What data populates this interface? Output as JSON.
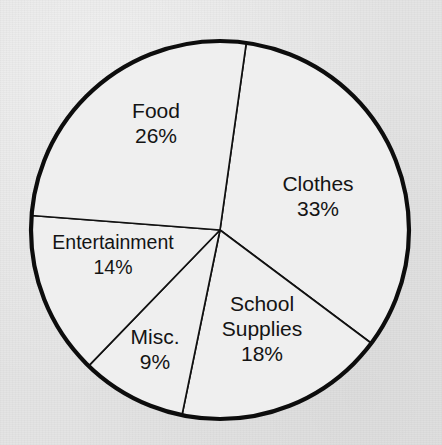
{
  "chart_data": {
    "type": "pie",
    "title": "",
    "subtitle": "",
    "xlabel": "",
    "ylabel": "",
    "legend": "none",
    "grid": false,
    "units": "percent",
    "total": 100,
    "start_angle_deg": 8,
    "direction": "clockwise",
    "categories": [
      "Clothes",
      "School Supplies",
      "Misc.",
      "Entertainment",
      "Food"
    ],
    "values": [
      33,
      18,
      9,
      14,
      26
    ],
    "slices": [
      {
        "name": "clothes",
        "label": "Clothes",
        "value": 33,
        "value_text": "33%",
        "label_lines": [
          "Clothes",
          "33%"
        ],
        "start_angle_deg": 8,
        "end_angle_deg": 126.8,
        "sweep_deg": 118.8,
        "fill": "#efefef",
        "label_x": 318,
        "label_y": 197
      },
      {
        "name": "school-supplies",
        "label": "School Supplies",
        "value": 18,
        "value_text": "18%",
        "label_lines": [
          "School",
          "Supplies",
          "18%"
        ],
        "start_angle_deg": 126.8,
        "end_angle_deg": 191.6,
        "sweep_deg": 64.8,
        "fill": "#efefef",
        "label_x": 262,
        "label_y": 330
      },
      {
        "name": "misc",
        "label": "Misc.",
        "value": 9,
        "value_text": "9%",
        "label_lines": [
          "Misc.",
          "9%"
        ],
        "start_angle_deg": 191.6,
        "end_angle_deg": 224.0,
        "sweep_deg": 32.4,
        "fill": "#efefef",
        "label_x": 155,
        "label_y": 350
      },
      {
        "name": "entertainment",
        "label": "Entertainment",
        "value": 14,
        "value_text": "14%",
        "label_lines": [
          "Entertainment",
          "14%"
        ],
        "start_angle_deg": 224.0,
        "end_angle_deg": 274.4,
        "sweep_deg": 50.4,
        "fill": "#efefef",
        "label_x": 113,
        "label_y": 256
      },
      {
        "name": "food",
        "label": "Food",
        "value": 26,
        "value_text": "26%",
        "label_lines": [
          "Food",
          "26%"
        ],
        "start_angle_deg": 274.4,
        "end_angle_deg": 368.0,
        "sweep_deg": 93.6,
        "fill": "#efefef",
        "label_x": 156,
        "label_y": 124
      }
    ],
    "geometry": {
      "center_x": 220,
      "center_y": 230,
      "radius": 189
    },
    "style": {
      "background": "#e4e4e4",
      "slice_fill": "#efefef",
      "outline": "#0d0d0d",
      "divider": "#111111",
      "text": "#141414"
    }
  }
}
